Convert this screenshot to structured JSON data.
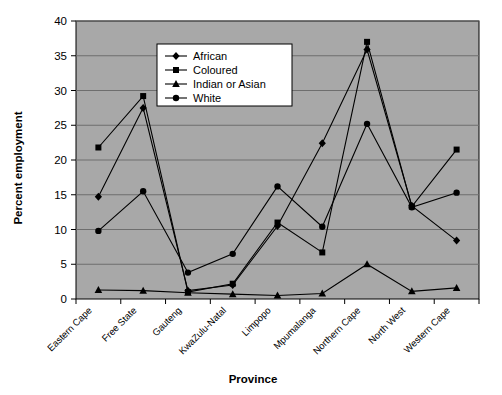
{
  "chart_data": {
    "type": "line",
    "title": "",
    "xlabel": "Province",
    "ylabel": "Percent employment",
    "categories": [
      "Eastern Cape",
      "Free State",
      "Gauteng",
      "KwaZulu-Natal",
      "Limpopo",
      "Mpumalanga",
      "Northern Cape",
      "North West",
      "Western Cape"
    ],
    "ylim": [
      0,
      40
    ],
    "ytick_labels": [
      "0",
      "5",
      "10",
      "15",
      "20",
      "25",
      "30",
      "35",
      "40"
    ],
    "yticks": [
      0,
      5,
      10,
      15,
      20,
      25,
      30,
      35,
      40
    ],
    "grid": true,
    "legend_position": "top-center-inside",
    "plot_background": "#a8a8a8",
    "series": [
      {
        "name": "African",
        "marker": "diamond",
        "values": [
          14.7,
          27.5,
          1.2,
          2.0,
          10.5,
          22.4,
          35.9,
          13.4,
          8.4
        ]
      },
      {
        "name": "Coloured",
        "marker": "square",
        "values": [
          21.8,
          29.2,
          1.0,
          2.2,
          11.0,
          6.7,
          37.0,
          13.3,
          21.5
        ]
      },
      {
        "name": "Indian or Asian",
        "marker": "triangle",
        "values": [
          1.3,
          1.2,
          0.9,
          0.7,
          0.5,
          0.8,
          5.0,
          1.1,
          1.6
        ]
      },
      {
        "name": "White",
        "marker": "circle",
        "values": [
          9.8,
          15.5,
          3.8,
          6.5,
          16.2,
          10.4,
          25.2,
          13.2,
          15.3
        ]
      }
    ]
  },
  "legend": {
    "entries": [
      {
        "label": "African"
      },
      {
        "label": "Coloured"
      },
      {
        "label": "Indian or Asian"
      },
      {
        "label": "White"
      }
    ]
  },
  "axes": {
    "y_title": "Percent employment",
    "x_title": "Province"
  }
}
